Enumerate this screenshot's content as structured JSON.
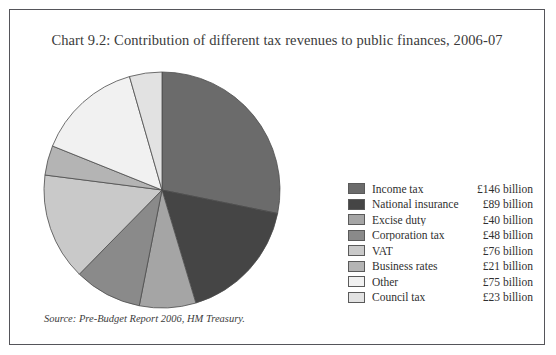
{
  "figure": {
    "title": "Chart 9.2: Contribution of different tax revenues to public finances, 2006-07",
    "source": "Source: Pre-Budget Report 2006, HM Treasury.",
    "frame_color": "#55555a",
    "background": "#ffffff"
  },
  "chart_data": {
    "type": "pie",
    "title": "Chart 9.2: Contribution of different tax revenues to public finances, 2006-07",
    "unit": "£ billion",
    "start_angle_deg": 0,
    "direction": "clockwise",
    "total": 518,
    "legend_position": "right",
    "grid": false,
    "categories": [
      "Income tax",
      "National insurance",
      "Excise duty",
      "Corporation tax",
      "VAT",
      "Business rates",
      "Other",
      "Council tax"
    ],
    "values": [
      146,
      89,
      40,
      48,
      76,
      21,
      75,
      23
    ],
    "value_labels": [
      "£146 billion",
      "£89 billion",
      "£40 billion",
      "£48 billion",
      "£76 billion",
      "£21 billion",
      "£75 billion",
      "£23 billion"
    ],
    "colors": [
      "#6b6b6b",
      "#454545",
      "#a5a5a5",
      "#8a8a8a",
      "#c9c9c9",
      "#b4b4b4",
      "#f1f1f1",
      "#e2e2e2"
    ],
    "slice_border_color": "#4d4d4d"
  },
  "legend": {
    "rows": [
      {
        "label": "Income tax",
        "value": "£146 billion",
        "color": "#6b6b6b"
      },
      {
        "label": "National insurance",
        "value": "£89 billion",
        "color": "#454545"
      },
      {
        "label": "Excise duty",
        "value": "£40 billion",
        "color": "#a5a5a5"
      },
      {
        "label": "Corporation tax",
        "value": "£48 billion",
        "color": "#8a8a8a"
      },
      {
        "label": "VAT",
        "value": "£76 billion",
        "color": "#c9c9c9"
      },
      {
        "label": "Business rates",
        "value": "£21 billion",
        "color": "#b4b4b4"
      },
      {
        "label": "Other",
        "value": "£75 billion",
        "color": "#f1f1f1"
      },
      {
        "label": "Council tax",
        "value": "£23 billion",
        "color": "#e2e2e2"
      }
    ]
  }
}
